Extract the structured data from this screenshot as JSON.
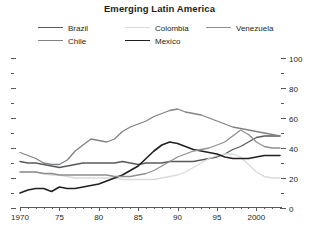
{
  "chart_data": {
    "type": "line",
    "title": "Emerging Latin America",
    "subtitle": "",
    "xlabel": "",
    "ylabel": "",
    "xlim": [
      1970,
      2003
    ],
    "ylim": [
      0,
      100
    ],
    "y_major_ticks": [
      0,
      20,
      40,
      60,
      80,
      100
    ],
    "y_minor_ticks": [
      10,
      30,
      50,
      70,
      90
    ],
    "x_tick_labels": [
      {
        "value": 1970,
        "label": "1970"
      },
      {
        "value": 1975,
        "label": "75"
      },
      {
        "value": 1980,
        "label": "80"
      },
      {
        "value": 1985,
        "label": "85"
      },
      {
        "value": 1990,
        "label": "90"
      },
      {
        "value": 1995,
        "label": "95"
      },
      {
        "value": 2000,
        "label": "2000"
      }
    ],
    "x_tick_step": 1,
    "grid": false,
    "legend_position": "top",
    "y_axis_side": "right",
    "x": [
      1970,
      1971,
      1972,
      1973,
      1974,
      1975,
      1976,
      1977,
      1978,
      1979,
      1980,
      1981,
      1982,
      1983,
      1984,
      1985,
      1986,
      1987,
      1988,
      1989,
      1990,
      1991,
      1992,
      1993,
      1994,
      1995,
      1996,
      1997,
      1998,
      1999,
      2000,
      2001,
      2002,
      2003
    ],
    "series": [
      {
        "name": "Brazil",
        "color": "#58595b",
        "width": 1.3,
        "values": [
          31,
          30,
          30,
          29,
          28,
          27,
          28,
          29,
          30,
          30,
          30,
          30,
          30,
          31,
          30,
          29,
          30,
          30,
          30,
          31,
          31,
          31,
          31,
          32,
          33,
          34,
          36,
          39,
          41,
          44,
          47,
          48,
          48,
          48
        ]
      },
      {
        "name": "Chile",
        "color": "#808285",
        "width": 1.3,
        "values": [
          37,
          35,
          33,
          30,
          29,
          29,
          32,
          38,
          42,
          46,
          45,
          44,
          46,
          51,
          54,
          56,
          58,
          61,
          63,
          65,
          66,
          64,
          63,
          62,
          60,
          58,
          56,
          54,
          53,
          52,
          51,
          50,
          49,
          48
        ]
      },
      {
        "name": "Colombia",
        "color": "#d9dadb",
        "width": 1.3,
        "values": [
          24,
          24,
          24,
          23,
          22,
          22,
          21,
          20,
          20,
          20,
          20,
          20,
          20,
          19,
          19,
          19,
          19,
          19,
          20,
          21,
          22,
          24,
          27,
          30,
          33,
          35,
          36,
          36,
          34,
          29,
          24,
          21,
          20,
          20
        ]
      },
      {
        "name": "Mexico",
        "color": "#231f20",
        "width": 1.6,
        "values": [
          10,
          12,
          13,
          13,
          11,
          14,
          13,
          13,
          14,
          15,
          16,
          18,
          20,
          22,
          25,
          28,
          33,
          38,
          42,
          44,
          43,
          41,
          39,
          38,
          37,
          36,
          34,
          33,
          33,
          33,
          34,
          35,
          35,
          35
        ]
      },
      {
        "name": "Venezuela",
        "color": "#8d8f91",
        "width": 1.3,
        "values": [
          24,
          24,
          24,
          23,
          23,
          22,
          22,
          22,
          22,
          22,
          22,
          22,
          21,
          21,
          21,
          22,
          23,
          25,
          28,
          31,
          34,
          36,
          38,
          39,
          40,
          42,
          44,
          48,
          52,
          49,
          44,
          41,
          40,
          40
        ]
      }
    ]
  },
  "legend": {
    "items": [
      {
        "id": "brazil",
        "label": "Brazil",
        "color": "#58595b",
        "width": 1.3
      },
      {
        "id": "chile",
        "label": "Chile",
        "color": "#808285",
        "width": 1.3
      },
      {
        "id": "colombia",
        "label": "Colombia",
        "color": "#d9dadb",
        "width": 1.3
      },
      {
        "id": "mexico",
        "label": "Mexico",
        "color": "#231f20",
        "width": 1.6
      },
      {
        "id": "venezuela",
        "label": "Venezuela",
        "color": "#8d8f91",
        "width": 1.3
      }
    ]
  },
  "colors": {
    "background": "#ffffff",
    "text": "#231f20",
    "axis": "#58595b"
  }
}
